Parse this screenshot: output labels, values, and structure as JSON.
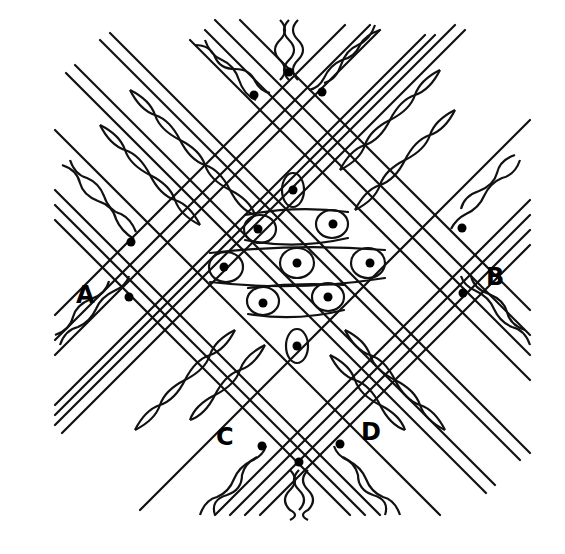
{
  "diagram": {
    "type": "bobbin-lace-pricking-diagram",
    "colors": {
      "ink": "#111111",
      "background": "#ffffff"
    },
    "labels": [
      {
        "id": "A",
        "text": "A",
        "x": 76,
        "y": 283
      },
      {
        "id": "B",
        "text": "B",
        "x": 486,
        "y": 265
      },
      {
        "id": "C",
        "text": "C",
        "x": 216,
        "y": 425
      },
      {
        "id": "D",
        "text": "D",
        "x": 361,
        "y": 420
      }
    ],
    "pins": [
      {
        "x": 289,
        "y": 72
      },
      {
        "x": 254,
        "y": 95
      },
      {
        "x": 322,
        "y": 92
      },
      {
        "x": 293,
        "y": 190
      },
      {
        "x": 258,
        "y": 229
      },
      {
        "x": 333,
        "y": 224
      },
      {
        "x": 224,
        "y": 267
      },
      {
        "x": 297,
        "y": 263
      },
      {
        "x": 370,
        "y": 263
      },
      {
        "x": 263,
        "y": 303
      },
      {
        "x": 328,
        "y": 297
      },
      {
        "x": 297,
        "y": 346
      },
      {
        "x": 131,
        "y": 242
      },
      {
        "x": 129,
        "y": 297
      },
      {
        "x": 462,
        "y": 228
      },
      {
        "x": 463,
        "y": 293
      },
      {
        "x": 262,
        "y": 446
      },
      {
        "x": 340,
        "y": 444
      },
      {
        "x": 299,
        "y": 462
      }
    ]
  }
}
